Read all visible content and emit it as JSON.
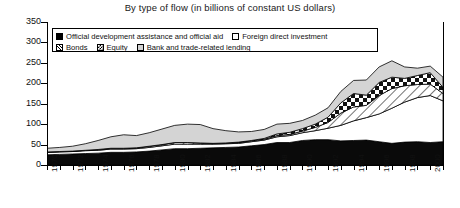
{
  "chart_data": {
    "type": "area",
    "stacked": true,
    "title": "By type of flow (in billions of constant US dollars)",
    "xlabel": "",
    "ylabel": "",
    "ylim": [
      0,
      350
    ],
    "yticks": [
      0,
      50,
      100,
      150,
      200,
      250,
      300,
      350
    ],
    "grid": false,
    "legend_position": "top-left-inside",
    "x": [
      1970,
      1971,
      1972,
      1973,
      1974,
      1975,
      1976,
      1977,
      1978,
      1979,
      1980,
      1981,
      1982,
      1983,
      1984,
      1985,
      1986,
      1987,
      1988,
      1989,
      1990,
      1991,
      1992,
      1993,
      1994,
      1995,
      1996,
      1997,
      1998,
      1999,
      2000,
      2001
    ],
    "xtick_labels": [
      "1970",
      "1972",
      "1974",
      "1976",
      "1978",
      "1980",
      "1982",
      "1984",
      "1986",
      "1988",
      "1990",
      "1992",
      "1994",
      "1996",
      "1998",
      "2000"
    ],
    "series": [
      {
        "name": "Official development assistance and official aid",
        "pattern": "solid-black",
        "color": "#000000",
        "values": [
          25,
          26,
          27,
          28,
          29,
          31,
          31,
          32,
          34,
          37,
          40,
          40,
          41,
          42,
          43,
          44,
          47,
          50,
          55,
          55,
          60,
          62,
          62,
          59,
          60,
          61,
          57,
          53,
          56,
          57,
          55,
          57
        ]
      },
      {
        "name": "Foreign direct investment",
        "pattern": "solid-white",
        "color": "#ffffff",
        "values": [
          6,
          6,
          6,
          7,
          7,
          8,
          8,
          8,
          9,
          10,
          11,
          11,
          10,
          9,
          9,
          9,
          10,
          11,
          14,
          17,
          19,
          22,
          28,
          38,
          48,
          55,
          68,
          86,
          98,
          108,
          115,
          100
        ]
      },
      {
        "name": "Bonds",
        "pattern": "diagonal-hatch",
        "color": "#ffffff",
        "values": [
          1,
          1,
          1,
          1,
          2,
          2,
          2,
          2,
          3,
          3,
          4,
          4,
          3,
          2,
          2,
          2,
          2,
          2,
          3,
          3,
          4,
          8,
          14,
          30,
          34,
          30,
          45,
          48,
          40,
          32,
          28,
          18
        ]
      },
      {
        "name": "Equity",
        "pattern": "checkerboard",
        "color": "#ffffff",
        "values": [
          0,
          0,
          0,
          0,
          0,
          0,
          0,
          0,
          0,
          0,
          0,
          0,
          0,
          0,
          0,
          1,
          1,
          2,
          4,
          5,
          6,
          8,
          13,
          25,
          33,
          25,
          32,
          28,
          18,
          22,
          28,
          15
        ]
      },
      {
        "name": "Bank and trade-related lending",
        "pattern": "light-gray",
        "color": "#d2d2d2",
        "values": [
          9,
          10,
          12,
          16,
          22,
          28,
          33,
          30,
          33,
          38,
          42,
          45,
          45,
          36,
          30,
          25,
          22,
          22,
          24,
          22,
          20,
          22,
          23,
          28,
          32,
          37,
          38,
          40,
          28,
          18,
          16,
          25
        ]
      }
    ]
  },
  "legend": {
    "entries": [
      {
        "label": "Official development assistance and official aid",
        "swatch": "sw-oda"
      },
      {
        "label": "Foreign direct investment",
        "swatch": "sw-fdi"
      },
      {
        "label": "Bonds",
        "swatch": "sw-bonds"
      },
      {
        "label": "Equity",
        "swatch": "sw-equity"
      },
      {
        "label": "Bank and trade-related lending",
        "swatch": "sw-bank"
      }
    ]
  }
}
